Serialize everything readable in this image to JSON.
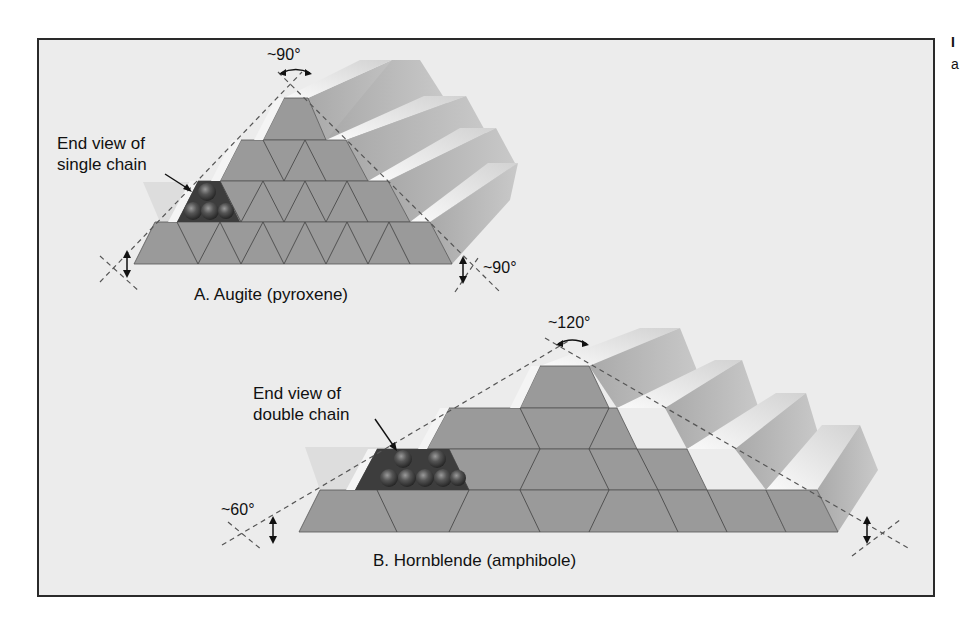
{
  "figure": {
    "panel_a": {
      "caption": "A. Augite (pyroxene)",
      "callout_line1": "End view of",
      "callout_line2": "single chain",
      "top_angle": "~90°",
      "base_angle": "~90°"
    },
    "panel_b": {
      "caption": "B. Hornblende (amphibole)",
      "callout_line1": "End view of",
      "callout_line2": "double chain",
      "top_angle": "~120°",
      "base_angle": "~60°"
    }
  },
  "margin": {
    "line1": "I",
    "line2": "a"
  },
  "colors": {
    "frame_bg": "#ececec",
    "tetra_face": "#9a9a9a",
    "ridge_light": "#e6e6e6",
    "ridge_side": "#b4b4b4",
    "chain_dark": "#3d3d3d"
  }
}
